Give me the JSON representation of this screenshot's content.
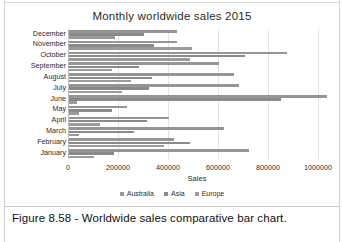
{
  "figure": {
    "caption": "Figure 8.58 - Worldwide sales comparative bar chart."
  },
  "chart_data": {
    "type": "bar",
    "orientation": "horizontal",
    "title": "Monthly worldwide sales 2015",
    "xlabel": "Sales",
    "ylabel": "",
    "xlim": [
      0,
      1000000
    ],
    "xticks": [
      "0",
      "200000",
      "400000",
      "600000",
      "800000",
      "1000000"
    ],
    "xtick_values": [
      0,
      200000,
      400000,
      600000,
      800000,
      1000000
    ],
    "grid": true,
    "legend_position": "bottom",
    "categories": [
      "January",
      "February",
      "March",
      "April",
      "May",
      "June",
      "July",
      "August",
      "September",
      "October",
      "November",
      "December"
    ],
    "series": [
      {
        "name": "Australia",
        "color": "#959595",
        "values": [
          720000,
          420000,
          620000,
          400000,
          232000,
          1110000,
          680000,
          660000,
          600000,
          872000,
          430000,
          432000
        ]
      },
      {
        "name": "Asia",
        "color": "#8a8a8a",
        "values": [
          180000,
          484000,
          260000,
          312000,
          170000,
          846000,
          320000,
          330000,
          280000,
          704000,
          340000,
          300000
        ]
      },
      {
        "name": "Europe",
        "color": "#9b9b9b",
        "values": [
          100000,
          380000,
          40000,
          124000,
          40000,
          30000,
          210000,
          248000,
          170000,
          484000,
          490000,
          184000
        ]
      }
    ]
  },
  "legend": {
    "items": [
      {
        "label": "Australia"
      },
      {
        "label": "Asia"
      },
      {
        "label": "Europe"
      }
    ]
  }
}
